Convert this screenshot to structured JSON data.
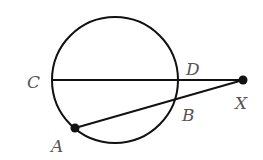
{
  "diagram": {
    "type": "geometry-circle-secants",
    "circle": {
      "cx": 115,
      "cy": 80,
      "r": 63
    },
    "points": {
      "C": {
        "label": "C",
        "x": 52,
        "y": 80
      },
      "D": {
        "label": "D",
        "x": 178,
        "y": 80
      },
      "X": {
        "label": "X",
        "x": 243,
        "y": 80
      },
      "A": {
        "label": "A",
        "x": 75,
        "y": 128
      },
      "B": {
        "label": "B",
        "x": 176,
        "y": 99
      }
    },
    "segments": [
      {
        "from": "C",
        "to": "X"
      },
      {
        "from": "A",
        "to": "X"
      }
    ],
    "colors": {
      "stroke": "#111111",
      "label": "#555555"
    }
  }
}
